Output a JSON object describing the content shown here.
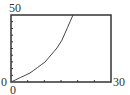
{
  "chart_data": {
    "type": "line",
    "title": "",
    "xlabel": "",
    "ylabel": "",
    "xlim": [
      0,
      30
    ],
    "ylim": [
      0,
      50
    ],
    "x_tick_step": 5,
    "y_tick_step": 5,
    "grid": false,
    "legend": null,
    "tick_labels": {
      "y_max": "50",
      "y_min": "0",
      "x_min": "0",
      "x_max": "30"
    },
    "series": [
      {
        "name": "curve",
        "x": [
          0,
          5.7,
          10.2,
          13.8,
          15.3,
          18.6
        ],
        "y": [
          0,
          6.7,
          14.9,
          25.4,
          31.3,
          50
        ]
      }
    ],
    "colors": {
      "frame": "#333333",
      "curve": "#444444"
    }
  }
}
